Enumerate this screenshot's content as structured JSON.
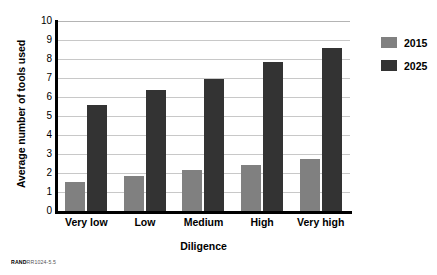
{
  "chart_data": {
    "type": "bar",
    "title": "",
    "xlabel": "Diligence",
    "ylabel": "Average number of tools used",
    "categories": [
      "Very low",
      "Low",
      "Medium",
      "High",
      "Very high"
    ],
    "series": [
      {
        "name": "2015",
        "color": "#808080",
        "values": [
          1.55,
          1.85,
          2.15,
          2.4,
          2.75
        ]
      },
      {
        "name": "2025",
        "color": "#333333",
        "values": [
          5.6,
          6.35,
          6.95,
          7.85,
          8.6
        ]
      }
    ],
    "ylim": [
      0,
      10
    ],
    "ytick_labels": [
      "0",
      "1",
      "2",
      "3",
      "4",
      "5",
      "6",
      "7",
      "8",
      "9",
      "10"
    ],
    "grid": true,
    "legend_position": "right"
  },
  "legend": {
    "entries": [
      {
        "label": "2015"
      },
      {
        "label": "2025"
      }
    ]
  },
  "source": {
    "brand": "RAND",
    "code": "RR1024-5.5"
  }
}
